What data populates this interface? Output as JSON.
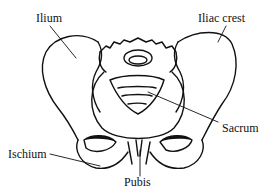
{
  "diagram": {
    "colors": {
      "line": "#111111",
      "background": "#ffffff"
    },
    "labels": {
      "ilium": "Ilium",
      "iliac_crest": "Iliac crest",
      "sacrum": "Sacrum",
      "ischium": "Ischium",
      "pubis": "Pubis"
    }
  }
}
